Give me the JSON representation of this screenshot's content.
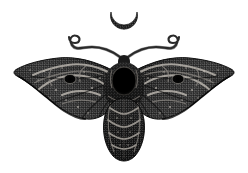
{
  "artwork": {
    "title": "Death's-head moth with crescent moon",
    "subject": "moth",
    "style": "dithered halftone engraving",
    "background_color": "#ffffff",
    "canvas": {
      "width": 248,
      "height": 173
    },
    "palette": {
      "background": "#ffffff",
      "ink_darkest": "#0a0a0a",
      "ink_dark": "#1e1e1e",
      "ink_mid": "#3a3a3a",
      "ink_light": "#5e5e5e",
      "highlight": "#b9b4ad",
      "highlight_soft": "#8f8a84",
      "void_black": "#000000"
    },
    "elements": {
      "moon": {
        "name": "crescent-moon",
        "label": "Crescent moon",
        "orientation": "cup-opening-downward",
        "center_x": 124,
        "center_y": 22,
        "radius": 13,
        "fill": "#242424"
      },
      "antennae": {
        "name": "antennae-pair",
        "label": "Curling antennae",
        "count": 2,
        "tip_style": "inward-spiral-hook",
        "left_tip_x": 68,
        "right_tip_x": 180,
        "tip_y": 36,
        "stroke": "#2a2a2a"
      },
      "head": {
        "name": "moth-head",
        "label": "Head",
        "center_x": 124,
        "center_y": 62,
        "fill": "#1c1c1c"
      },
      "thorax": {
        "name": "moth-thorax",
        "label": "Thorax",
        "center_x": 124,
        "center_y": 86,
        "fill": "#222222"
      },
      "thorax_void": {
        "name": "thorax-void",
        "label": "Black void marking",
        "center_x": 124,
        "center_y": 81,
        "radius_x": 12,
        "radius_y": 14,
        "fill": "#000000"
      },
      "abdomen": {
        "name": "moth-abdomen",
        "label": "Segmented abdomen",
        "center_x": 124,
        "top_y": 100,
        "bottom_y": 160,
        "segments": 5,
        "fill": "#1f1f1f"
      },
      "wing_left": {
        "name": "wing-left",
        "label": "Left wing",
        "tip_x": 16,
        "tip_y": 66,
        "fill": "#2b2b2b",
        "eyespot": {
          "cx": 70,
          "cy": 79,
          "r": 5,
          "fill": "#080808"
        }
      },
      "wing_right": {
        "name": "wing-right",
        "label": "Right wing",
        "tip_x": 232,
        "tip_y": 66,
        "fill": "#2b2b2b",
        "eyespot": {
          "cx": 178,
          "cy": 79,
          "r": 5,
          "fill": "#080808"
        }
      },
      "scrollwork": {
        "name": "wing-scrollwork",
        "label": "Wing scrollwork bands",
        "stroke": "#b9b4ad"
      },
      "speckles": {
        "name": "wing-speckles",
        "label": "Light speckle dots",
        "fill": "#c4bfb8"
      }
    }
  }
}
